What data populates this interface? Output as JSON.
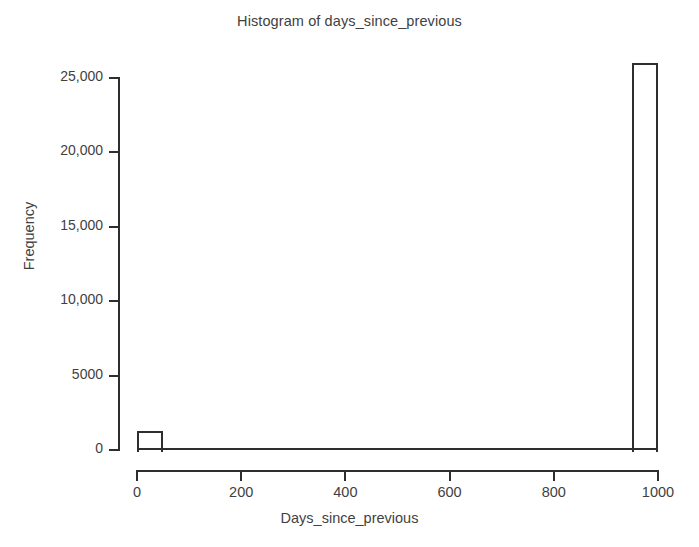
{
  "chart_data": {
    "type": "bar",
    "title": "Histogram of days_since_previous",
    "xlabel": "Days_since_previous",
    "ylabel": "Frequency",
    "xlim": [
      0,
      1000
    ],
    "ylim": [
      0,
      26500
    ],
    "grid": false,
    "legend": null,
    "x_ticks": [
      {
        "value": 0,
        "label": "0"
      },
      {
        "value": 200,
        "label": "200"
      },
      {
        "value": 400,
        "label": "400"
      },
      {
        "value": 600,
        "label": "600"
      },
      {
        "value": 800,
        "label": "800"
      },
      {
        "value": 1000,
        "label": "1000"
      }
    ],
    "y_ticks": [
      {
        "value": 0,
        "label": "0"
      },
      {
        "value": 5000,
        "label": "5000"
      },
      {
        "value": 10000,
        "label": "10,000"
      },
      {
        "value": 15000,
        "label": "15,000"
      },
      {
        "value": 20000,
        "label": "20,000"
      },
      {
        "value": 25000,
        "label": "25,000"
      }
    ],
    "bin_width": 50,
    "bins": [
      {
        "x0": 0,
        "x1": 50,
        "value": 1300
      },
      {
        "x0": 50,
        "x1": 100,
        "value": 0
      },
      {
        "x0": 100,
        "x1": 150,
        "value": 0
      },
      {
        "x0": 150,
        "x1": 200,
        "value": 0
      },
      {
        "x0": 200,
        "x1": 250,
        "value": 0
      },
      {
        "x0": 250,
        "x1": 300,
        "value": 0
      },
      {
        "x0": 300,
        "x1": 350,
        "value": 0
      },
      {
        "x0": 350,
        "x1": 400,
        "value": 0
      },
      {
        "x0": 400,
        "x1": 450,
        "value": 0
      },
      {
        "x0": 450,
        "x1": 500,
        "value": 0
      },
      {
        "x0": 500,
        "x1": 550,
        "value": 0
      },
      {
        "x0": 550,
        "x1": 600,
        "value": 0
      },
      {
        "x0": 600,
        "x1": 650,
        "value": 0
      },
      {
        "x0": 650,
        "x1": 700,
        "value": 0
      },
      {
        "x0": 700,
        "x1": 750,
        "value": 0
      },
      {
        "x0": 750,
        "x1": 800,
        "value": 0
      },
      {
        "x0": 800,
        "x1": 850,
        "value": 0
      },
      {
        "x0": 850,
        "x1": 900,
        "value": 0
      },
      {
        "x0": 900,
        "x1": 950,
        "value": 0
      },
      {
        "x0": 950,
        "x1": 1000,
        "value": 26000
      }
    ],
    "categories": [
      "0-50",
      "950-1000"
    ],
    "values": [
      1300,
      26000
    ],
    "colors": {
      "bar_edge": "#2e2e2e",
      "bar_fill": "#ffffff",
      "axis": "#2e2e2e",
      "text": "#3f3f3f",
      "background": "#ffffff"
    }
  },
  "page": {
    "caption_partial": ""
  }
}
